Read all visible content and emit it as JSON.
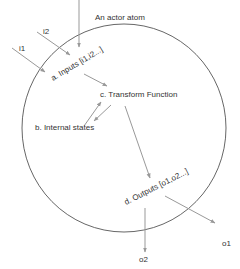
{
  "title": "An actor atom",
  "nodes": {
    "inputs": "a. Inputs [i1,i2...]",
    "internal_states": "b. Internal states",
    "transform": "c. Transform Function",
    "outputs": "d. Outputs [o1,o2...]"
  },
  "external": {
    "inputs": [
      "i1",
      "i2"
    ],
    "outputs": [
      "o1",
      "o2"
    ]
  },
  "colors": {
    "circle": "#555555",
    "arrow": "#999999",
    "text": "#333333"
  },
  "edges": [
    {
      "from": "i1",
      "to": "inputs"
    },
    {
      "from": "i2",
      "to": "inputs"
    },
    {
      "from": "top",
      "to": "inputs"
    },
    {
      "from": "inputs",
      "to": "transform"
    },
    {
      "from": "internal_states",
      "to": "transform"
    },
    {
      "from": "transform",
      "to": "internal_states"
    },
    {
      "from": "transform",
      "to": "outputs"
    },
    {
      "from": "outputs",
      "to": "o1"
    },
    {
      "from": "outputs",
      "to": "o2"
    }
  ]
}
